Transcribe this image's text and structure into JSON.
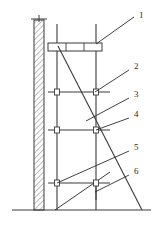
{
  "figure": {
    "type": "engineering-elevation-drawing",
    "background_color": "#ffffff",
    "line_color": "#3a3a3a",
    "hatch_color": "#5a5a5a",
    "callout_color": "#2b2b2b"
  },
  "callouts": [
    {
      "id": "1",
      "label": "1",
      "text_x": 139,
      "text_y": 18,
      "leader": {
        "x1": 134,
        "y1": 17,
        "x2": 96,
        "y2": 44
      }
    },
    {
      "id": "2",
      "label": "2",
      "text_x": 134,
      "text_y": 69,
      "leader": {
        "x1": 129,
        "y1": 70,
        "x2": 95,
        "y2": 92
      }
    },
    {
      "id": "3",
      "label": "3",
      "text_x": 134,
      "text_y": 97,
      "leader": {
        "x1": 129,
        "y1": 98,
        "x2": 86,
        "y2": 121
      }
    },
    {
      "id": "4",
      "label": "4",
      "text_x": 134,
      "text_y": 117,
      "leader": {
        "x1": 129,
        "y1": 118,
        "x2": 96,
        "y2": 130
      }
    },
    {
      "id": "5",
      "label": "5",
      "text_x": 134,
      "text_y": 150,
      "leader": {
        "x1": 129,
        "y1": 151,
        "x2": 57,
        "y2": 183
      }
    },
    {
      "id": "6",
      "label": "6",
      "text_x": 134,
      "text_y": 174,
      "leader": {
        "x1": 129,
        "y1": 175,
        "x2": 95,
        "y2": 192
      }
    }
  ],
  "wall": {
    "name": "hatched-masonry-wall",
    "x": 34,
    "y": 20,
    "width": 10,
    "height": 190,
    "hatch_spacing": 4,
    "cap": {
      "x1": 31,
      "y1": 19,
      "x2": 47,
      "y2": 19
    }
  },
  "ground": {
    "name": "ground-line",
    "x1": 12,
    "y1": 210,
    "x2": 151,
    "y2": 210
  },
  "posts": [
    {
      "name": "inner-standard-post",
      "x": 57,
      "y_top": 24,
      "y_bottom": 210
    },
    {
      "name": "outer-standard-post",
      "x": 96,
      "y_top": 24,
      "y_bottom": 210
    }
  ],
  "platform": {
    "name": "working-platform",
    "x": 48,
    "y": 43,
    "width": 54,
    "height": 8,
    "plank_dividers": [
      66,
      84
    ]
  },
  "ledgers": [
    {
      "name": "ledger-upper",
      "x1": 48,
      "y1": 92,
      "x2": 110,
      "y2": 92
    },
    {
      "name": "ledger-middle",
      "x1": 48,
      "y1": 130,
      "x2": 110,
      "y2": 130
    },
    {
      "name": "ledger-lower",
      "x1": 48,
      "y1": 183,
      "x2": 110,
      "y2": 183
    }
  ],
  "connector_nodes": [
    {
      "name": "coupler-node",
      "x": 57,
      "y": 92
    },
    {
      "name": "coupler-node",
      "x": 96,
      "y": 92
    },
    {
      "name": "coupler-node",
      "x": 57,
      "y": 130
    },
    {
      "name": "coupler-node",
      "x": 96,
      "y": 130
    },
    {
      "name": "coupler-node",
      "x": 57,
      "y": 183
    },
    {
      "name": "coupler-node",
      "x": 96,
      "y": 183
    }
  ],
  "diagonal_brace": {
    "name": "primary-diagonal-brace",
    "x1": 58,
    "y1": 46,
    "x2": 142,
    "y2": 210
  },
  "secondary_braces": [
    {
      "name": "lower-diagonal-brace",
      "x1": 55,
      "y1": 210,
      "x2": 110,
      "y2": 172
    },
    {
      "name": "lower-tie-brace",
      "x1": 96,
      "y1": 200,
      "x2": 96,
      "y2": 183
    }
  ]
}
